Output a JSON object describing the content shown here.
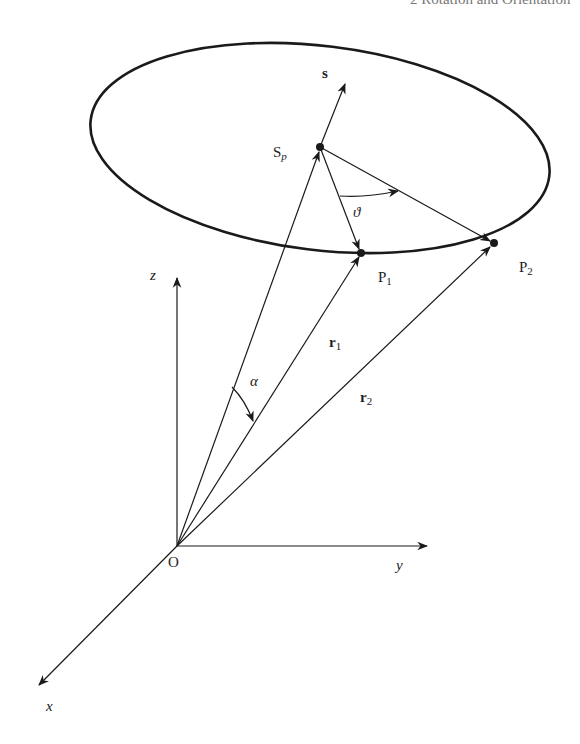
{
  "header": {
    "running_title": "2 Rotation and Orientation"
  },
  "figure": {
    "labels": {
      "s": "s",
      "sp_main": "S",
      "sp_sub": "p",
      "theta": "ϑ",
      "p1_main": "P",
      "p1_sub": "1",
      "p2_main": "P",
      "p2_sub": "2",
      "z": "z",
      "r1_main": "r",
      "r1_sub": "1",
      "r2_main": "r",
      "r2_sub": "2",
      "alpha": "α",
      "origin": "O",
      "y": "y",
      "x": "x"
    },
    "colors": {
      "stroke": "#1a1a1a",
      "header": "#777777"
    }
  }
}
